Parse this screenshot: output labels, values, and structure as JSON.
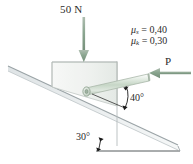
{
  "figure": {
    "background_color": "#ffffff"
  },
  "labels": {
    "applied_load": "50 N",
    "force_p": "P",
    "rod_angle": "40°",
    "incline_angle": "30°",
    "mu_static_symbol": "μ",
    "mu_static_sub": "s",
    "mu_static_eq": " = 0,40",
    "mu_kinetic_symbol": "μ",
    "mu_kinetic_sub": "k",
    "mu_kinetic_eq": " = 0,30"
  },
  "colors": {
    "arrow_green": "#8aa58f",
    "rod_green": "#cfdccf",
    "block_fill": "#f3f5f3",
    "outline_gray": "#b9bfbd",
    "text": "#2b2b2b",
    "leader_black": "#1a1a1a"
  },
  "values": {
    "applied_load_newtons": 50,
    "mu_static": 0.4,
    "mu_kinetic": 0.3,
    "rod_angle_degrees": 40,
    "incline_angle_degrees": 30
  }
}
